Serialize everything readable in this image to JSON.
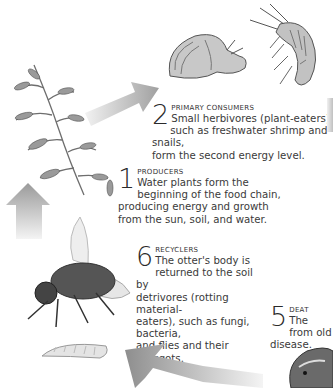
{
  "diagram": {
    "type": "food-chain-cycle",
    "steps": [
      {
        "number": "2",
        "title": "PRIMARY CONSUMERS",
        "line1": "Small herbivores (plant-eaters),",
        "rest": [
          "such as freshwater shrimp and snails,",
          "form the second energy level."
        ]
      },
      {
        "number": "1",
        "title": "PRODUCERS",
        "line1": "Water plants form the",
        "rest": [
          "beginning of the food chain,",
          "producing energy and growth",
          "from the sun, soil, and water."
        ]
      },
      {
        "number": "6",
        "title": "RECYCLERS",
        "line1": "The otter's body is",
        "rest": [
          "returned to the soil by",
          "detrivores (rotting material-",
          "eaters), such as fungi, bacteria,",
          "and flies and their maggots."
        ]
      },
      {
        "number": "5",
        "title": "DEAT",
        "line1": "The",
        "rest": [
          "from old",
          "disease."
        ]
      }
    ],
    "illustrations": [
      "water-plant",
      "snail",
      "freshwater-shrimp",
      "fly",
      "maggot",
      "otter"
    ],
    "arrow_color": "#a8a8a8"
  }
}
